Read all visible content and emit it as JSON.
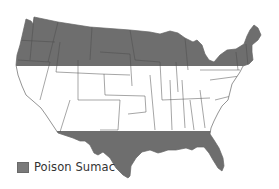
{
  "map": {
    "subject": "United States (contiguous)",
    "region_color": "#6e6e6e",
    "border_color": "#555555",
    "shaded_bands": [
      {
        "name": "northern-band",
        "y_top": 14,
        "y_bottom": 66
      },
      {
        "name": "southern-band",
        "y_top": 131,
        "y_bottom": 182
      }
    ]
  },
  "legend": {
    "items": [
      {
        "label": "Poison Sumac",
        "color": "#7a7a7a"
      }
    ]
  }
}
